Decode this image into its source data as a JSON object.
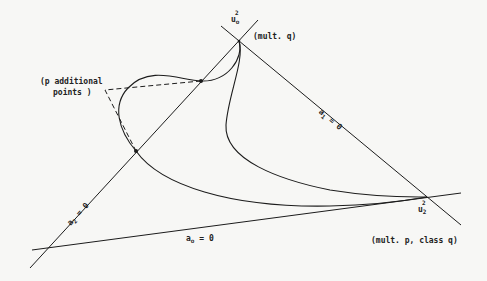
{
  "diagram": {
    "colors": {
      "ink": "#1c1c1c",
      "background": "#f7f7f5"
    },
    "vertices": {
      "top": {
        "label": "u",
        "subscript": "o",
        "superscript": "2",
        "note": "(mult. q)"
      },
      "right": {
        "label": "u",
        "subscript": "2",
        "superscript": "2",
        "note": "(mult. p, class q)"
      }
    },
    "lines": {
      "a0": {
        "label": "a",
        "subscript": "o",
        "eq": "= 0"
      },
      "a1": {
        "label": "a",
        "subscript": "1",
        "eq": "= 0"
      },
      "a2": {
        "label": "a",
        "subscript": "2",
        "eq": "= 0"
      }
    },
    "annotation": {
      "line1": "(p additional",
      "line2": "points )"
    }
  }
}
